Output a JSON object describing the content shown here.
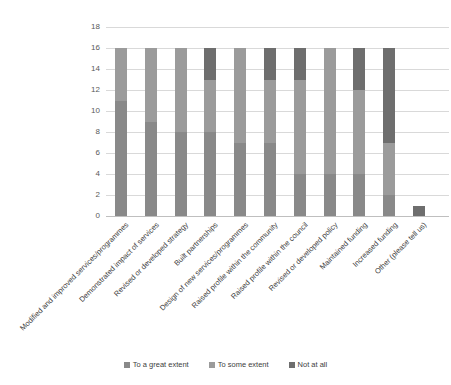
{
  "chart_data": {
    "type": "bar",
    "variant": "stacked-column",
    "title": "",
    "xlabel": "",
    "ylabel": "",
    "ylim": [
      0,
      18
    ],
    "ytick_step": 2,
    "grid": true,
    "legend_position": "bottom",
    "categories": [
      "Modified and improved services/programmes",
      "Demonstrated impact of  services",
      "Revised or developed strategy",
      "Built partnerships",
      "Design of new services/programmes",
      "Raised profile within the community",
      "Raised profile within the council",
      "Revised or developed policy",
      "Maintained funding",
      "Increased funding",
      "Other (please tell us)"
    ],
    "series": [
      {
        "name": "To a great extent",
        "color": "#898989",
        "values": [
          11,
          9,
          8,
          8,
          7,
          7,
          4,
          4,
          4,
          2,
          0
        ]
      },
      {
        "name": "To some extent",
        "color": "#9b9b9b",
        "values": [
          5,
          7,
          8,
          5,
          9,
          6,
          9,
          12,
          8,
          5,
          0
        ]
      },
      {
        "name": "Not at all",
        "color": "#6e6e6e",
        "values": [
          0,
          0,
          0,
          3,
          0,
          3,
          3,
          0,
          4,
          9,
          1
        ]
      }
    ]
  },
  "layout_colors": {
    "gridline": "#d9d9d9",
    "axis_line": "#bfbfbf",
    "tick_text": "#595959",
    "label_text": "#404040"
  }
}
